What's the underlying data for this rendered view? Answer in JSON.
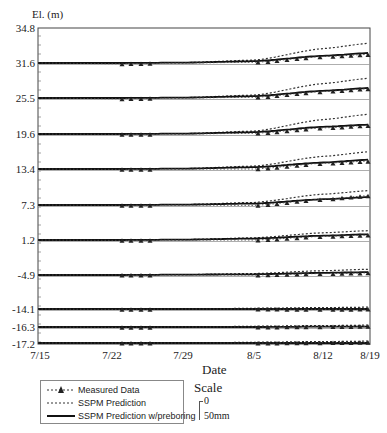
{
  "chart_data": {
    "type": "line",
    "title": "",
    "xlabel": "Date",
    "ylabel": "El. (m)",
    "x_ticks": [
      "7/15",
      "7/22",
      "7/29",
      "8/5",
      "8/12",
      "8/19"
    ],
    "y_ticks": [
      "34.8",
      "31.6",
      "25.5",
      "19.6",
      "13.4",
      "7.3",
      "1.2",
      "-4.9",
      "-14.1",
      "-16.3",
      "-17.2"
    ],
    "grid": false,
    "legend_position": "bottom-left",
    "scale": {
      "title": "Scale",
      "min_label": "0",
      "max_label": "50mm"
    },
    "note": "Settlement (mm, upward plotted) relative to each elevation baseline; scale bar 50mm",
    "x_days": [
      0,
      7,
      14,
      21,
      28,
      35
    ],
    "series_groups": [
      {
        "elevation": 31.6,
        "ssp_prediction_mm": [
          0,
          0,
          1,
          8,
          40,
          55
        ],
        "ssp_preboring_mm": [
          0,
          0,
          1,
          5,
          20,
          28
        ],
        "measured_mm": [
          0,
          -2,
          0,
          2,
          18,
          24
        ]
      },
      {
        "elevation": 25.5,
        "ssp_prediction_mm": [
          0,
          0,
          1,
          8,
          40,
          55
        ],
        "ssp_preboring_mm": [
          0,
          0,
          1,
          5,
          20,
          28
        ],
        "measured_mm": [
          0,
          -2,
          0,
          2,
          18,
          26
        ]
      },
      {
        "elevation": 19.6,
        "ssp_prediction_mm": [
          0,
          0,
          1,
          8,
          40,
          55
        ],
        "ssp_preboring_mm": [
          0,
          0,
          1,
          5,
          20,
          26
        ],
        "measured_mm": [
          0,
          -1,
          0,
          2,
          17,
          24
        ]
      },
      {
        "elevation": 13.4,
        "ssp_prediction_mm": [
          0,
          0,
          1,
          8,
          35,
          48
        ],
        "ssp_preboring_mm": [
          0,
          0,
          1,
          5,
          18,
          26
        ],
        "measured_mm": [
          0,
          -1,
          0,
          0,
          16,
          22
        ]
      },
      {
        "elevation": 7.3,
        "ssp_prediction_mm": [
          0,
          0,
          1,
          7,
          30,
          40
        ],
        "ssp_preboring_mm": [
          0,
          0,
          1,
          4,
          16,
          22
        ],
        "measured_mm": [
          0,
          -1,
          0,
          -1,
          16,
          26
        ]
      },
      {
        "elevation": 1.2,
        "ssp_prediction_mm": [
          0,
          0,
          1,
          6,
          20,
          26
        ],
        "ssp_preboring_mm": [
          0,
          0,
          1,
          4,
          12,
          16
        ],
        "measured_mm": [
          0,
          -1,
          0,
          0,
          10,
          14
        ]
      },
      {
        "elevation": -4.9,
        "ssp_prediction_mm": [
          0,
          0,
          1,
          4,
          12,
          16
        ],
        "ssp_preboring_mm": [
          0,
          0,
          1,
          2,
          6,
          8
        ],
        "measured_mm": [
          0,
          0,
          0,
          0,
          4,
          6
        ]
      },
      {
        "elevation": -14.1,
        "ssp_prediction_mm": [
          0,
          0,
          0,
          2,
          4,
          5
        ],
        "ssp_preboring_mm": [
          0,
          0,
          0,
          0,
          0,
          0
        ],
        "measured_mm": [
          0,
          -1,
          0,
          0,
          -1,
          0
        ]
      },
      {
        "elevation": -16.3,
        "ssp_prediction_mm": [
          0,
          0,
          0,
          2,
          4,
          5
        ],
        "ssp_preboring_mm": [
          0,
          0,
          0,
          0,
          1,
          1
        ],
        "measured_mm": [
          0,
          -1,
          0,
          0,
          1,
          2
        ]
      },
      {
        "elevation": -17.2,
        "ssp_prediction_mm": [
          0,
          0,
          0,
          2,
          4,
          5
        ],
        "ssp_preboring_mm": [
          0,
          0,
          0,
          0,
          0,
          0
        ],
        "measured_mm": [
          0,
          0,
          0,
          0,
          1,
          2
        ]
      }
    ],
    "series": [
      {
        "name": "Measured Data",
        "style": "dotted with triangle markers"
      },
      {
        "name": "SSPM Prediction",
        "style": "dotted"
      },
      {
        "name": "SSPM Prediction w/preboring",
        "style": "solid"
      }
    ]
  },
  "axis": {
    "y_title": "El. (m)",
    "x_title": "Date",
    "y_ticks": [
      "34.8",
      "31.6",
      "25.5",
      "19.6",
      "13.4",
      "7.3",
      "1.2",
      "-4.9",
      "-14.1",
      "-16.3",
      "-17.2"
    ],
    "x_ticks": [
      "7/15",
      "7/22",
      "7/29",
      "8/5",
      "8/12",
      "8/19"
    ]
  },
  "legend": {
    "measured": "Measured Data",
    "ssp": "SSPM Prediction",
    "ssp_preboring": "SSPM Prediction w/preboring"
  },
  "scale": {
    "title": "Scale",
    "zero": "0",
    "max": "50mm"
  }
}
